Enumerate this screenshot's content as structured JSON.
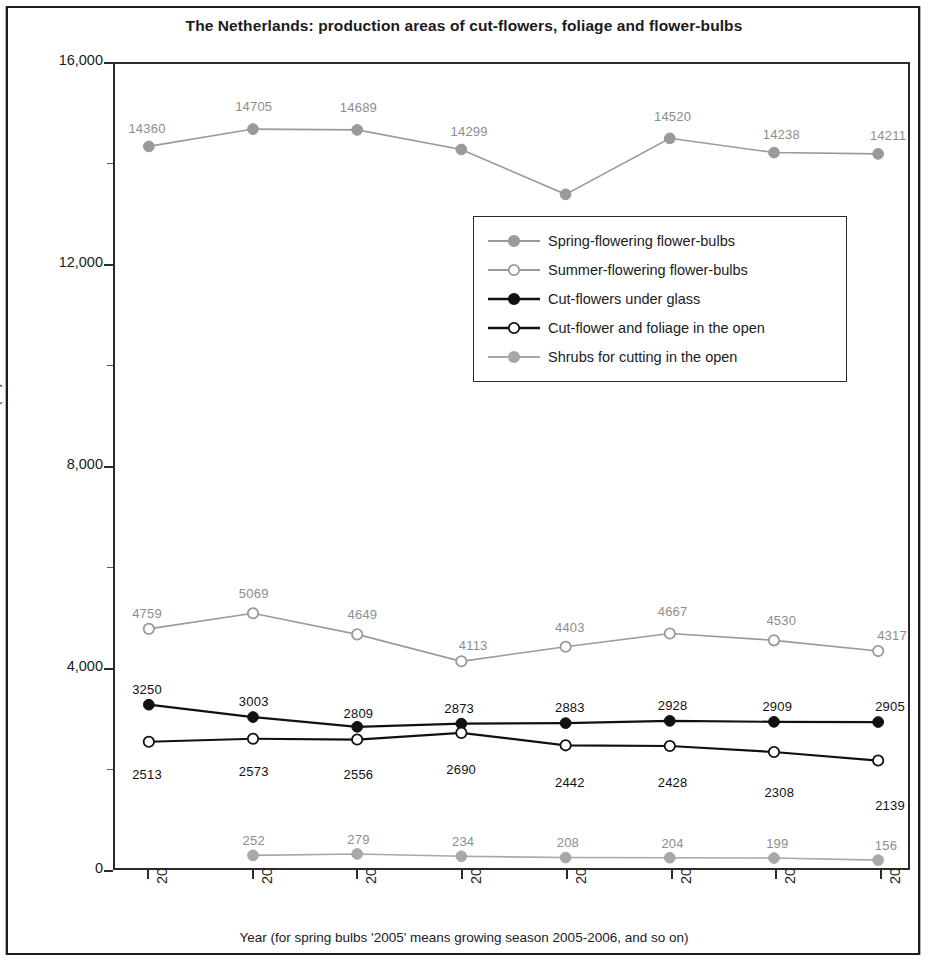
{
  "chart_data": {
    "type": "line",
    "title": "The Netherlands: production areas of cut-flowers, foliage and flower-bulbs",
    "xlabel": "Year (for spring bulbs '2005' means growing season 2005-2006, and so on)",
    "ylabel": "Area (ha)",
    "categories": [
      "2005",
      "2007",
      "2008",
      "2009",
      "2010",
      "2011",
      "2012",
      "2013"
    ],
    "ylim": [
      0,
      16000
    ],
    "yticks": [
      "0",
      "4,000",
      "8,000",
      "12,000",
      "16,000"
    ],
    "ytick_values": [
      0,
      4000,
      8000,
      12000,
      16000
    ],
    "grid": false,
    "legend_position": "center-right",
    "series": [
      {
        "name": "Spring-flowering flower-bulbs",
        "marker": "filled-circle",
        "color": "#9a9a9a",
        "values": [
          14360,
          14705,
          14689,
          14299,
          13406,
          14520,
          14238,
          14211
        ],
        "labels": [
          "14360",
          "14705",
          "14689",
          "14299",
          "13406",
          "14520",
          "14238",
          "14211"
        ]
      },
      {
        "name": "Summer-flowering flower-bulbs",
        "marker": "open-circle",
        "color": "#9a9a9a",
        "values": [
          4759,
          5069,
          4649,
          4113,
          4403,
          4667,
          4530,
          4317
        ],
        "labels": [
          "4759",
          "5069",
          "4649",
          "4113",
          "4403",
          "4667",
          "4530",
          "4317"
        ]
      },
      {
        "name": "Cut-flowers under glass",
        "marker": "filled-circle",
        "color": "#111111",
        "values": [
          3250,
          3003,
          2809,
          2873,
          2883,
          2928,
          2909,
          2905
        ],
        "labels": [
          "3250",
          "3003",
          "2809",
          "2873",
          "2883",
          "2928",
          "2909",
          "2905"
        ]
      },
      {
        "name": "Cut-flower and foliage in the open",
        "marker": "open-circle",
        "color": "#111111",
        "values": [
          2513,
          2573,
          2556,
          2690,
          2442,
          2428,
          2308,
          2139
        ],
        "labels": [
          "2513",
          "2573",
          "2556",
          "2690",
          "2442",
          "2428",
          "2308",
          "2139"
        ]
      },
      {
        "name": "Shrubs for cutting in the open",
        "marker": "filled-circle",
        "color": "#a8a8a8",
        "values": [
          null,
          252,
          279,
          234,
          208,
          204,
          199,
          156
        ],
        "labels": [
          "",
          "252",
          "279",
          "234",
          "208",
          "204",
          "199",
          "156"
        ]
      }
    ]
  },
  "legend": {
    "items": [
      {
        "label": "Spring-flowering flower-bulbs"
      },
      {
        "label": "Summer-flowering flower-bulbs"
      },
      {
        "label": "Cut-flowers under glass"
      },
      {
        "label": "Cut-flower and foliage in the open"
      },
      {
        "label": "Shrubs for cutting in the open"
      }
    ]
  }
}
